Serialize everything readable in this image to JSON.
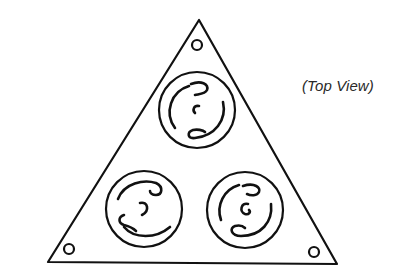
{
  "figure": {
    "caption": "(Top View)",
    "stroke_color": "#111111",
    "background_color": "#ffffff",
    "plate": {
      "shape": "triangle",
      "vertices": [
        [
          199,
          20
        ],
        [
          48,
          262
        ],
        [
          337,
          264
        ]
      ]
    },
    "mounting_holes": [
      {
        "name": "top",
        "cx": 197,
        "cy": 45,
        "r": 5
      },
      {
        "name": "bottom-left",
        "cx": 69,
        "cy": 249,
        "r": 5
      },
      {
        "name": "bottom-right",
        "cx": 314,
        "cy": 252,
        "r": 5
      }
    ],
    "receptacles": [
      {
        "name": "top",
        "cx": 197,
        "cy": 110,
        "r": 38
      },
      {
        "name": "bottom-left",
        "cx": 144,
        "cy": 209,
        "r": 38
      },
      {
        "name": "bottom-right",
        "cx": 245,
        "cy": 210,
        "r": 38
      }
    ]
  }
}
